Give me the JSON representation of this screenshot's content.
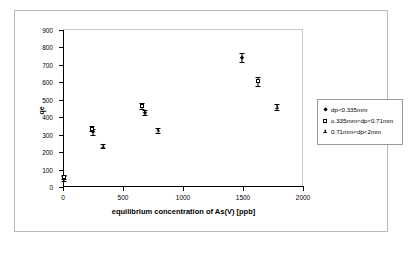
{
  "chart_data": {
    "type": "scatter",
    "title": "",
    "xlabel": "equilibrium concentration of As(V) [ppb]",
    "ylabel": "qe",
    "xlim": [
      0,
      2000
    ],
    "ylim": [
      0,
      900
    ],
    "xticks": [
      0,
      500,
      1000,
      1500,
      2000
    ],
    "yticks": [
      0,
      100,
      200,
      300,
      400,
      500,
      600,
      700,
      800,
      900
    ],
    "grid": false,
    "legend_position": "right",
    "series": [
      {
        "name": "dp<0.335mm",
        "marker": "filled-diamond",
        "points": [
          {
            "x": 10,
            "y": 50,
            "yerr": 14
          },
          {
            "x": 250,
            "y": 315,
            "yerr": 16
          },
          {
            "x": 685,
            "y": 425,
            "yerr": 14
          },
          {
            "x": 1495,
            "y": 740,
            "yerr": 26
          }
        ]
      },
      {
        "name": "o.335mm<dp<0.71mm",
        "marker": "open-square",
        "points": [
          {
            "x": 5,
            "y": 55,
            "yerr": 12
          },
          {
            "x": 240,
            "y": 335,
            "yerr": 12
          },
          {
            "x": 655,
            "y": 465,
            "yerr": 16
          },
          {
            "x": 1625,
            "y": 605,
            "yerr": 24
          }
        ]
      },
      {
        "name": "0.71mm<dp<2mm",
        "marker": "open-triangle",
        "points": [
          {
            "x": 330,
            "y": 235,
            "yerr": 12
          },
          {
            "x": 790,
            "y": 325,
            "yerr": 14
          },
          {
            "x": 1780,
            "y": 460,
            "yerr": 18
          }
        ]
      }
    ]
  },
  "legend": {
    "entries": [
      {
        "label": "dp<0.335mm"
      },
      {
        "label": "o.335mm<dp<0.71mm"
      },
      {
        "label": "0.71mm<dp<2mm"
      }
    ]
  }
}
